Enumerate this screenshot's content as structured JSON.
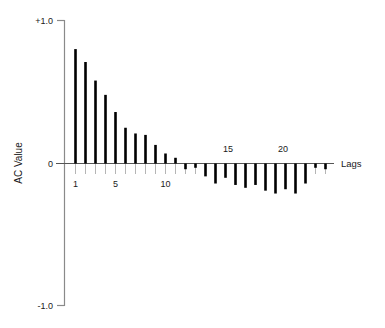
{
  "chart_data": {
    "type": "bar",
    "title": "",
    "subtitle": "",
    "xlabel": "Lags",
    "ylabel": "AC Value",
    "xlim": [
      0,
      27.5
    ],
    "ylim": [
      -1.0,
      1.0
    ],
    "grid": false,
    "legend": null,
    "y_tick_labels": [
      "+1.0",
      "0",
      "-1.0"
    ],
    "y_tick_values": [
      1.0,
      0,
      -1.0
    ],
    "x_tick_labels": [
      "1",
      "5",
      "10",
      "15",
      "20"
    ],
    "x_tick_values": [
      1,
      5,
      10,
      15,
      20
    ],
    "x_ticks_below_axis": [
      1,
      5,
      10
    ],
    "x_ticks_above_axis": [
      15,
      20
    ],
    "categories": [
      1,
      2,
      3,
      4,
      5,
      6,
      7,
      8,
      9,
      10,
      11,
      12,
      13,
      14,
      15,
      16,
      17,
      18,
      19,
      20,
      21,
      22,
      23,
      24,
      25,
      26
    ],
    "values": [
      0.8,
      0.71,
      0.58,
      0.48,
      0.36,
      0.25,
      0.21,
      0.2,
      0.13,
      0.07,
      0.04,
      -0.04,
      -0.03,
      -0.09,
      -0.14,
      -0.1,
      -0.15,
      -0.17,
      -0.15,
      -0.19,
      -0.21,
      -0.18,
      -0.21,
      -0.14,
      -0.03,
      -0.04
    ],
    "series": [
      {
        "name": "Autocorrelation",
        "values": [
          0.8,
          0.71,
          0.58,
          0.48,
          0.36,
          0.25,
          0.21,
          0.2,
          0.13,
          0.07,
          0.04,
          -0.04,
          -0.03,
          -0.09,
          -0.14,
          -0.1,
          -0.15,
          -0.17,
          -0.15,
          -0.19,
          -0.21,
          -0.18,
          -0.21,
          -0.14,
          -0.03,
          -0.04
        ]
      }
    ],
    "bar_color": "#000000",
    "axis_color": "#808080",
    "zero_line_color": "#555555"
  },
  "axes": {
    "y_top_label": "+1.0",
    "y_zero_label": "0",
    "y_bottom_label": "-1.0",
    "y_axis_title": "AC Value",
    "x_axis_title": "Lags",
    "x_labels": {
      "one": "1",
      "five": "5",
      "ten": "10",
      "fifteen": "15",
      "twenty": "20"
    }
  }
}
